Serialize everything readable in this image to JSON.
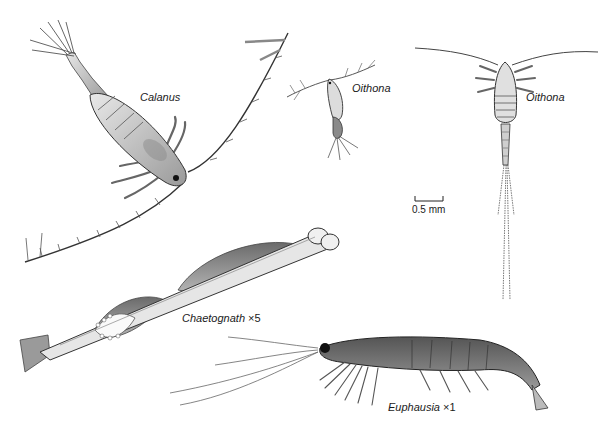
{
  "figure": {
    "background": "#ffffff",
    "ink_color": "#2a2a2a",
    "labels": {
      "calanus": {
        "name": "Calanus"
      },
      "oithona_small": {
        "name": "Oithona"
      },
      "oithona_large": {
        "name": "Oithona"
      },
      "chaetognath": {
        "name": "Chaetognath",
        "magnification": "×5"
      },
      "euphausia": {
        "name": "Euphausia",
        "magnification": "×1"
      }
    },
    "scale_bar": {
      "label": "0.5 mm"
    }
  }
}
